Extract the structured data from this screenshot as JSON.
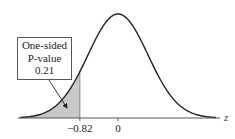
{
  "chart_data": {
    "type": "area",
    "title": "",
    "xlabel": "z",
    "ylabel": "",
    "distribution": "standard normal",
    "mean": 0,
    "sd": 1,
    "shaded_region": {
      "from": "-inf",
      "to": -0.82,
      "area": 0.21
    },
    "tick_labels": [
      "-0.82",
      "0"
    ],
    "ticks": [
      -0.82,
      0
    ],
    "annotation": {
      "lines": [
        "One-sided",
        "P-value",
        "0.21"
      ],
      "points_to": "shaded left tail"
    },
    "grid": false,
    "legend": null,
    "colors": {
      "curve": "#222222",
      "shade": "#c8c8c8",
      "axis": "#555555"
    }
  },
  "labels": {
    "annotation_line1": "One-sided",
    "annotation_line2": "P-value",
    "annotation_line3": "0.21",
    "tick_neg": "−0.82",
    "tick_zero": "0",
    "axis_var": "z"
  }
}
